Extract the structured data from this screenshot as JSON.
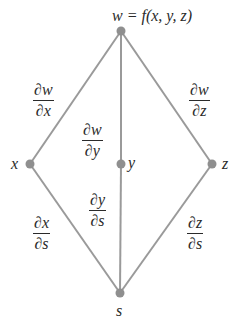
{
  "diagram": {
    "type": "tree",
    "colors": {
      "edge": "#9a9a9a",
      "node": "#8f8f8f",
      "text": "#2a2a2a",
      "background": "#ffffff"
    },
    "nodes": [
      {
        "id": "w",
        "label": "w = f(x, y, z)",
        "x": 121,
        "y": 31
      },
      {
        "id": "x",
        "label": "x",
        "x": 30,
        "y": 164
      },
      {
        "id": "y",
        "label": "y",
        "x": 121,
        "y": 164
      },
      {
        "id": "z",
        "label": "z",
        "x": 212,
        "y": 164
      },
      {
        "id": "s",
        "label": "s",
        "x": 120,
        "y": 293
      }
    ],
    "edges": [
      {
        "from": "w",
        "to": "x",
        "label": {
          "num": "∂w",
          "den": "∂x"
        }
      },
      {
        "from": "w",
        "to": "y",
        "label": {
          "num": "∂w",
          "den": "∂y"
        }
      },
      {
        "from": "w",
        "to": "z",
        "label": {
          "num": "∂w",
          "den": "∂z"
        }
      },
      {
        "from": "x",
        "to": "s",
        "label": {
          "num": "∂x",
          "den": "∂s"
        }
      },
      {
        "from": "y",
        "to": "s",
        "label": {
          "num": "∂y",
          "den": "∂s"
        }
      },
      {
        "from": "z",
        "to": "s",
        "label": {
          "num": "∂z",
          "den": "∂s"
        }
      }
    ]
  }
}
